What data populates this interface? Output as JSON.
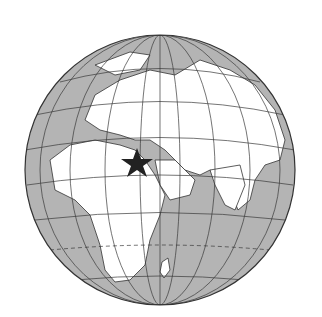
{
  "map": {
    "type": "orthographic-globe",
    "colors": {
      "ocean": "#b4b4b4",
      "land": "#ffffff",
      "border": "#333333",
      "graticule": "#3a3a3a",
      "marker": "#222222"
    },
    "marker": {
      "shape": "star",
      "region": "Egypt / Levant"
    },
    "visible_regions": [
      "Europe",
      "Africa",
      "Middle East",
      "Asia",
      "India",
      "Arabian Peninsula",
      "Madagascar",
      "Scandinavia"
    ]
  }
}
